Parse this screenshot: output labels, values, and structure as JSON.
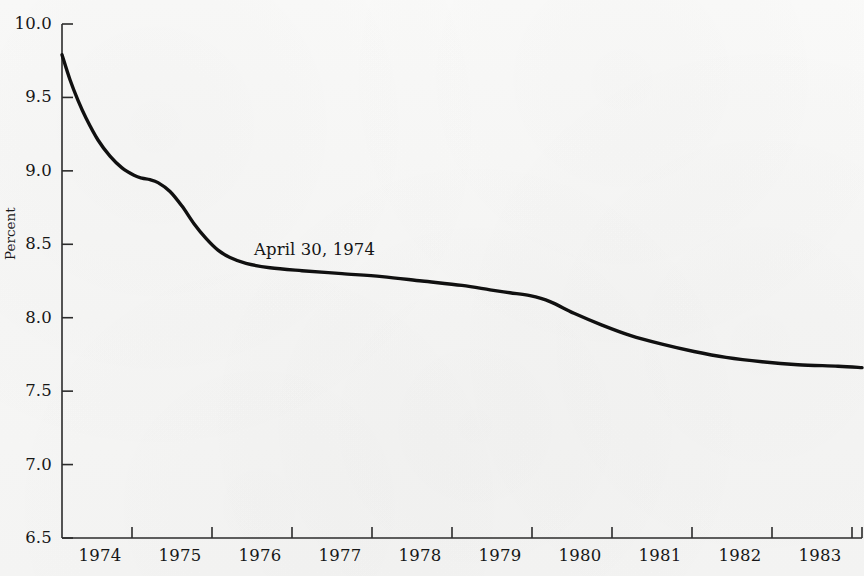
{
  "figure": {
    "background_color": "#f8f8f7",
    "line_color": "#101010",
    "axis_color": "#2b2b2b",
    "text_color": "#171717"
  },
  "axes": {
    "y_title": "Percent",
    "y_ticks": [
      "10.0",
      "9.5",
      "9.0",
      "8.5",
      "8.0",
      "7.5",
      "7.0",
      "6.5"
    ],
    "x_ticks": [
      "1974",
      "1975",
      "1976",
      "1977",
      "1978",
      "1979",
      "1980",
      "1981",
      "1982",
      "1983",
      "1984"
    ]
  },
  "annotations": [
    {
      "text": "April 30, 1974",
      "x_value": 1977.1,
      "y_value": 8.45
    }
  ],
  "chart_data": {
    "type": "line",
    "title": "",
    "xlabel": "",
    "ylabel": "Percent",
    "xlim": [
      1974.0,
      1984.0
    ],
    "ylim": [
      6.5,
      10.0
    ],
    "ytick_step": 0.5,
    "grid": false,
    "legend": null,
    "annotation": "April 30, 1974",
    "series": [
      {
        "name": "Yield curve",
        "x": [
          1974.0,
          1974.1,
          1974.2,
          1974.3,
          1974.45,
          1974.6,
          1974.75,
          1974.9,
          1975.0,
          1975.1,
          1975.2,
          1975.35,
          1975.5,
          1975.65,
          1975.8,
          1975.95,
          1976.1,
          1976.3,
          1976.6,
          1977.0,
          1977.5,
          1978.0,
          1978.5,
          1979.0,
          1979.35,
          1979.6,
          1979.85,
          1980.1,
          1980.4,
          1980.75,
          1981.1,
          1981.5,
          1981.9,
          1982.3,
          1982.75,
          1983.2,
          1983.7,
          1984.0
        ],
        "y": [
          9.79,
          9.62,
          9.48,
          9.36,
          9.21,
          9.1,
          9.02,
          8.97,
          8.95,
          8.94,
          8.92,
          8.86,
          8.76,
          8.64,
          8.54,
          8.46,
          8.41,
          8.37,
          8.34,
          8.32,
          8.3,
          8.28,
          8.25,
          8.22,
          8.19,
          8.17,
          8.15,
          8.11,
          8.03,
          7.95,
          7.88,
          7.82,
          7.77,
          7.73,
          7.7,
          7.68,
          7.67,
          7.66
        ]
      }
    ]
  }
}
